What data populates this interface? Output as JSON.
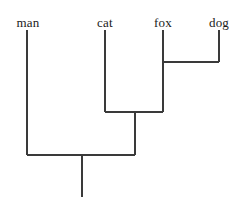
{
  "figure": {
    "kind": "phylogenetic-tree",
    "width": 242,
    "height": 208,
    "background_color": "#ffffff",
    "line_color": "#3a3a3a",
    "text_color": "#1a1a1a",
    "line_width": 1.1
  },
  "leaves": [
    {
      "id": "man",
      "label": "man",
      "x": 27,
      "label_x": 28,
      "label_y": 16,
      "line_top": 30,
      "line_bottom": 155
    },
    {
      "id": "cat",
      "label": "cat",
      "x": 105,
      "label_x": 105,
      "label_y": 16,
      "line_top": 30,
      "line_bottom": 112
    },
    {
      "id": "fox",
      "label": "fox",
      "x": 163,
      "label_x": 163,
      "label_y": 16,
      "line_top": 30,
      "line_bottom": 62
    },
    {
      "id": "dog",
      "label": "dog",
      "x": 219,
      "label_x": 219,
      "label_y": 16,
      "line_top": 30,
      "line_bottom": 62
    }
  ],
  "nodes": [
    {
      "id": "fox-dog-clade",
      "children": [
        "fox",
        "dog"
      ],
      "join_y": 62,
      "bar_x1": 163,
      "bar_x2": 219,
      "stem_x": 163,
      "stem_to_y": 112
    },
    {
      "id": "cat-carnivore-clade",
      "children": [
        "cat",
        "fox-dog-clade"
      ],
      "join_y": 112,
      "bar_x1": 105,
      "bar_x2": 163,
      "stem_x": 135,
      "stem_to_y": 155
    },
    {
      "id": "root-clade",
      "children": [
        "man",
        "cat-carnivore-clade"
      ],
      "join_y": 155,
      "bar_x1": 27,
      "bar_x2": 135,
      "stem_x": 82,
      "stem_to_y": 197
    }
  ]
}
